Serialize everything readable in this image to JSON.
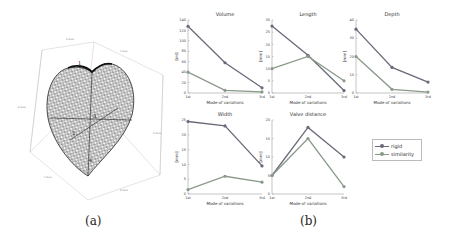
{
  "figure": {
    "captions": {
      "a": "(a)",
      "b": "(b)"
    },
    "heart_model": {
      "labels": [
        "1",
        "2",
        "3",
        "4"
      ],
      "axis_labels": [
        "X Axis",
        "Y Axis",
        "Z Axis",
        "X Axis",
        "Y Axis",
        "Z Axis"
      ]
    },
    "legend": {
      "items": [
        {
          "label": "rigid",
          "color": "#6a6a7a"
        },
        {
          "label": "similarity",
          "color": "#8a9a8a"
        }
      ]
    },
    "xlabel": "Mode of variations"
  },
  "chart_data": [
    {
      "type": "line",
      "title": "Volume",
      "xlabel": "Mode of variations",
      "ylabel": "[ml]",
      "categories": [
        "1st",
        "2nd",
        "3rd"
      ],
      "ylim": [
        0,
        140
      ],
      "yticks": [
        0,
        20,
        40,
        60,
        80,
        100,
        120,
        140
      ],
      "series": [
        {
          "name": "rigid",
          "values": [
            128,
            58,
            10
          ]
        },
        {
          "name": "similarity",
          "values": [
            40,
            5,
            2
          ]
        }
      ]
    },
    {
      "type": "line",
      "title": "Length",
      "xlabel": "Mode of variations",
      "ylabel": "[mm]",
      "categories": [
        "1st",
        "2nd",
        "3rd"
      ],
      "ylim": [
        0,
        30
      ],
      "yticks": [
        0,
        5,
        10,
        15,
        20,
        25,
        30
      ],
      "series": [
        {
          "name": "rigid",
          "values": [
            27.5,
            15.5,
            1
          ]
        },
        {
          "name": "similarity",
          "values": [
            10,
            15,
            5
          ]
        }
      ]
    },
    {
      "type": "line",
      "title": "Depth",
      "xlabel": "Mode of variations",
      "ylabel": "[mm]",
      "categories": [
        "1st",
        "2nd",
        "3rd"
      ],
      "ylim": [
        0,
        40
      ],
      "yticks": [
        0,
        10,
        20,
        30,
        40
      ],
      "series": [
        {
          "name": "rigid",
          "values": [
            35,
            14,
            6
          ]
        },
        {
          "name": "similarity",
          "values": [
            20,
            2,
            0.5
          ]
        }
      ]
    },
    {
      "type": "line",
      "title": "Width",
      "xlabel": "Mode of variations",
      "ylabel": "[mm]",
      "categories": [
        "1st",
        "2nd",
        "3rd"
      ],
      "ylim": [
        0,
        25
      ],
      "yticks": [
        0,
        5,
        10,
        15,
        20,
        25
      ],
      "series": [
        {
          "name": "rigid",
          "values": [
            24.5,
            23,
            9.5
          ]
        },
        {
          "name": "similarity",
          "values": [
            1.5,
            6,
            4
          ]
        }
      ]
    },
    {
      "type": "line",
      "title": "Valve distance",
      "xlabel": "Mode of variations",
      "ylabel": "[mm]",
      "categories": [
        "1st",
        "2nd",
        "3rd"
      ],
      "ylim": [
        0,
        20
      ],
      "yticks": [
        0,
        5,
        10,
        15,
        20
      ],
      "series": [
        {
          "name": "rigid",
          "values": [
            5,
            18,
            10
          ]
        },
        {
          "name": "similarity",
          "values": [
            5,
            15,
            2
          ]
        }
      ]
    }
  ]
}
